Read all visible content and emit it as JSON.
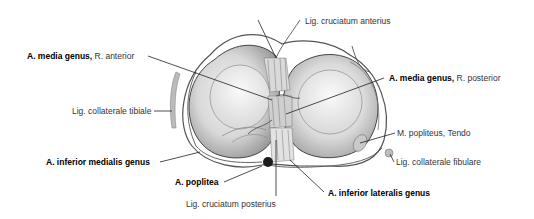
{
  "figure": {
    "type": "anatomical illustration",
    "labels": [
      {
        "id": "lig-cruciatum-anterius",
        "bold": "",
        "normal": "Lig. cruciatum anterius"
      },
      {
        "id": "a-media-genus-anterior",
        "bold": "A. media genus,",
        "normal": " R. anterior"
      },
      {
        "id": "a-media-genus-posterior",
        "bold": "A. media genus,",
        "normal": " R. posterior"
      },
      {
        "id": "lig-collaterale-tibiale",
        "bold": "",
        "normal": "Lig. collaterale tibiale"
      },
      {
        "id": "m-popliteus-tendo",
        "bold": "",
        "normal": "M. popliteus, Tendo"
      },
      {
        "id": "lig-collaterale-fibulare",
        "bold": "",
        "normal": "Lig. collaterale fibulare"
      },
      {
        "id": "a-inferior-medialis-genus",
        "bold": "A. inferior medialis genus",
        "normal": ""
      },
      {
        "id": "a-poplitea",
        "bold": "A. poplitea",
        "normal": ""
      },
      {
        "id": "lig-cruciatum-posterius",
        "bold": "",
        "normal": "Lig. cruciatum posterius"
      },
      {
        "id": "a-inferior-lateralis-genus",
        "bold": "A. inferior lateralis genus",
        "normal": ""
      }
    ]
  },
  "colors": {
    "background": "#ffffff",
    "line": "#333333",
    "tissue_light": "#e6e6e6",
    "tissue_mid": "#bdbdbd",
    "tissue_dark": "#8a8a8a"
  }
}
